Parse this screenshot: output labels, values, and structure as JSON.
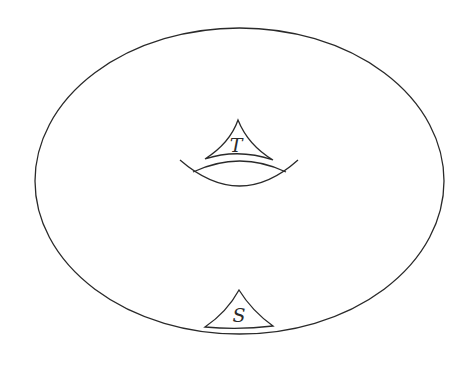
{
  "diagram": {
    "type": "torus-sketch",
    "stroke_color": "#2a2a2a",
    "background": "#ffffff",
    "labels": {
      "top_triangle": "T",
      "bottom_triangle": "S"
    }
  }
}
